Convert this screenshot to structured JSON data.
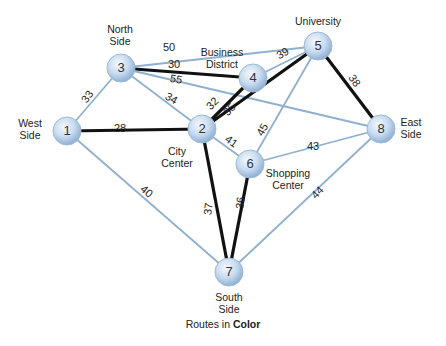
{
  "diagram": {
    "title": "Routes in Color",
    "caption_prefix": "Routes in",
    "caption_bold": "Color",
    "colors": {
      "route_edge": "#111111",
      "other_edge": "#8fb0cf",
      "node_fill": "#c9dcf0",
      "node_stroke": "#9fbad6"
    },
    "nodes": [
      {
        "id": "1",
        "label": "West Side",
        "lines": [
          "West",
          "Side"
        ],
        "x": 67,
        "y": 131,
        "label_x": 30,
        "label_y": 127,
        "anchor": "middle"
      },
      {
        "id": "2",
        "label": "City Center",
        "lines": [
          "City",
          "Center"
        ],
        "x": 202,
        "y": 129,
        "label_x": 177,
        "label_y": 155,
        "anchor": "middle"
      },
      {
        "id": "3",
        "label": "North Side",
        "lines": [
          "North",
          "Side"
        ],
        "x": 121,
        "y": 68,
        "label_x": 120,
        "label_y": 33,
        "anchor": "middle"
      },
      {
        "id": "4",
        "label": "Business District",
        "lines": [
          "Business",
          "District"
        ],
        "x": 253,
        "y": 78,
        "label_x": 222,
        "label_y": 56,
        "anchor": "middle"
      },
      {
        "id": "5",
        "label": "University",
        "lines": [
          "University"
        ],
        "x": 318,
        "y": 46,
        "label_x": 318,
        "label_y": 25,
        "anchor": "middle"
      },
      {
        "id": "6",
        "label": "Shopping Center",
        "lines": [
          "Shopping",
          "Center"
        ],
        "x": 250,
        "y": 164,
        "label_x": 288,
        "label_y": 177,
        "anchor": "middle"
      },
      {
        "id": "7",
        "label": "South Side",
        "lines": [
          "South",
          "Side"
        ],
        "x": 229,
        "y": 272,
        "label_x": 229,
        "label_y": 301,
        "anchor": "middle"
      },
      {
        "id": "8",
        "label": "East Side",
        "lines": [
          "East",
          "Side"
        ],
        "x": 381,
        "y": 129,
        "label_x": 411,
        "label_y": 126,
        "anchor": "middle"
      }
    ],
    "edges": [
      {
        "from": "1",
        "to": "3",
        "weight": 33,
        "route": false,
        "lx": 88,
        "ly": 97,
        "rot": -55
      },
      {
        "from": "1",
        "to": "2",
        "weight": 28,
        "route": true,
        "lx": 120,
        "ly": 129,
        "rot": 0
      },
      {
        "from": "1",
        "to": "7",
        "weight": 40,
        "route": false,
        "lx": 146,
        "ly": 192,
        "rot": 40
      },
      {
        "from": "3",
        "to": "5",
        "weight": 50,
        "route": false,
        "lx": 169,
        "ly": 48,
        "rot": 0
      },
      {
        "from": "3",
        "to": "4",
        "weight": 30,
        "route": true,
        "lx": 174,
        "ly": 65,
        "rot": 0
      },
      {
        "from": "3",
        "to": "8",
        "weight": 55,
        "route": false,
        "lx": 176,
        "ly": 80,
        "rot": 10
      },
      {
        "from": "3",
        "to": "2",
        "weight": 34,
        "route": false,
        "lx": 171,
        "ly": 99,
        "rot": 30
      },
      {
        "from": "2",
        "to": "4",
        "weight": 32,
        "route": true,
        "lx": 213,
        "ly": 104,
        "rot": -45
      },
      {
        "from": "2",
        "to": "5",
        "weight": 35,
        "route": true,
        "lx": 230,
        "ly": 110,
        "rot": -45
      },
      {
        "from": "4",
        "to": "5",
        "weight": 39,
        "route": false,
        "lx": 283,
        "ly": 54,
        "rot": -30
      },
      {
        "from": "5",
        "to": "8",
        "weight": 38,
        "route": true,
        "lx": 354,
        "ly": 81,
        "rot": 55
      },
      {
        "from": "5",
        "to": "6",
        "weight": 45,
        "route": false,
        "lx": 263,
        "ly": 130,
        "rot": -60
      },
      {
        "from": "2",
        "to": "6",
        "weight": 41,
        "route": false,
        "lx": 231,
        "ly": 142,
        "rot": 35
      },
      {
        "from": "6",
        "to": "8",
        "weight": 43,
        "route": false,
        "lx": 313,
        "ly": 147,
        "rot": 0
      },
      {
        "from": "2",
        "to": "7",
        "weight": 37,
        "route": true,
        "lx": 209,
        "ly": 209,
        "rot": -85
      },
      {
        "from": "6",
        "to": "7",
        "weight": 36,
        "route": true,
        "lx": 241,
        "ly": 203,
        "rot": -85
      },
      {
        "from": "8",
        "to": "7",
        "weight": 44,
        "route": false,
        "lx": 318,
        "ly": 193,
        "rot": -45
      }
    ]
  }
}
